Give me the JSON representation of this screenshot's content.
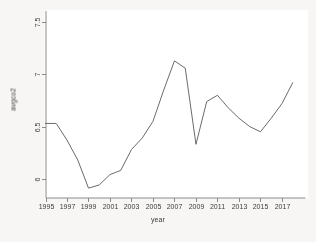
{
  "chart_data": {
    "type": "line",
    "title": "",
    "subtitle": "",
    "xlabel": "year",
    "ylabel": "avgco2",
    "x": [
      1995,
      1996,
      1997,
      1998,
      1999,
      2000,
      2001,
      2002,
      2003,
      2004,
      2005,
      2006,
      2007,
      2008,
      2009,
      2010,
      2011,
      2012,
      2013,
      2014,
      2015,
      2016,
      2017,
      2018
    ],
    "values": [
      6.53,
      6.53,
      6.37,
      6.18,
      5.91,
      5.94,
      6.04,
      6.08,
      6.28,
      6.39,
      6.55,
      6.85,
      7.13,
      7.06,
      6.33,
      6.74,
      6.8,
      6.68,
      6.58,
      6.5,
      6.45,
      6.58,
      6.72,
      6.92
    ],
    "series": [
      {
        "name": "avgco2",
        "values": [
          6.53,
          6.53,
          6.37,
          6.18,
          5.91,
          5.94,
          6.04,
          6.08,
          6.28,
          6.39,
          6.55,
          6.85,
          7.13,
          7.06,
          6.33,
          6.74,
          6.8,
          6.68,
          6.58,
          6.5,
          6.45,
          6.58,
          6.72,
          6.92
        ],
        "color": "#6b6b6b"
      }
    ],
    "xlim": [
      1995,
      2018.4
    ],
    "ylim": [
      5.82,
      7.56
    ],
    "xticks": [
      1995,
      1997,
      1999,
      2001,
      2003,
      2005,
      2007,
      2009,
      2011,
      2013,
      2015,
      2017
    ],
    "xtick_labels": [
      "1995",
      "1997",
      "1999",
      "2001",
      "2003",
      "2005",
      "2007",
      "2009",
      "2011",
      "2013",
      "2015",
      "2017"
    ],
    "yticks": [
      6,
      6.5,
      7,
      7.5
    ],
    "ytick_labels": [
      "6",
      "6.5",
      "7",
      "7.5"
    ],
    "grid": false,
    "legend": null,
    "legend_position": "none",
    "annotations": [],
    "line_color": "#6b6b6b",
    "axis_color": "#8a8a8a",
    "tick_label_color": "#3c3c3c",
    "background_color": "#ffffff"
  }
}
